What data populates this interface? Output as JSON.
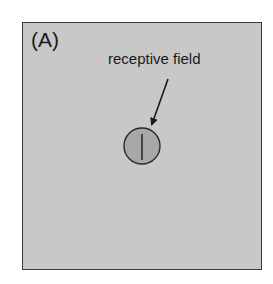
{
  "figure": {
    "panel_label": "(A)",
    "annotation": "receptive field",
    "colors": {
      "background": "#c8c8c8",
      "border": "#3a3a3a",
      "receptive_field_fill": "#a8a8a8",
      "stroke": "#1a1a1a"
    },
    "receptive_field": {
      "shape": "circle",
      "contains": "vertical bar stimulus"
    },
    "arrow": {
      "points_to": "receptive field"
    }
  }
}
